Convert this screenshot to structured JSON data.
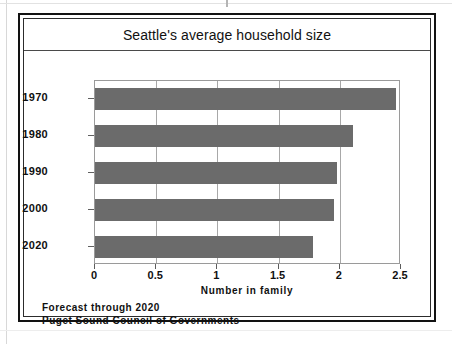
{
  "chart_data": {
    "type": "bar",
    "orientation": "horizontal",
    "title": "Seattle's average household size",
    "xlabel": "Number in family",
    "ylabel": "",
    "categories": [
      "1970",
      "1980",
      "1990",
      "2000",
      "2020"
    ],
    "values": [
      2.46,
      2.11,
      1.98,
      1.95,
      1.78
    ],
    "xlim": [
      0,
      2.5
    ],
    "xticks": [
      "0",
      "0.5",
      "1",
      "1.5",
      "2",
      "2.5"
    ],
    "xtick_values": [
      0,
      0.5,
      1,
      1.5,
      2,
      2.5
    ],
    "grid": "vertical",
    "legend": "none",
    "bar_color": "#6b6b6b",
    "annotations": [
      "Forecast through 2020",
      "Puget Sound Council of Governments"
    ]
  },
  "figure": {
    "title": "Seattle's average household size",
    "axis_title": "Number in family",
    "footer": {
      "line1": "Forecast through 2020",
      "line2": "Puget Sound Council of Governments"
    }
  }
}
